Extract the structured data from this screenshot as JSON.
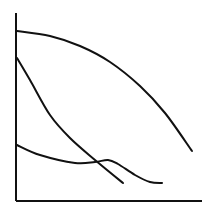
{
  "chart_data": {
    "type": "line",
    "title": "",
    "xlabel": "",
    "ylabel": "",
    "grid": false,
    "legend": null,
    "axes": {
      "y_axis": {
        "x": 16,
        "y1": 13,
        "y2": 201
      },
      "x_axis": {
        "y": 201,
        "x1": 16,
        "x2": 202
      }
    },
    "series": [
      {
        "name": "curve-1",
        "points": [
          [
            17,
            31
          ],
          [
            50,
            36
          ],
          [
            80,
            46
          ],
          [
            110,
            62
          ],
          [
            140,
            86
          ],
          [
            165,
            113
          ],
          [
            192,
            151
          ]
        ]
      },
      {
        "name": "curve-2",
        "points": [
          [
            17,
            58
          ],
          [
            30,
            80
          ],
          [
            50,
            115
          ],
          [
            70,
            138
          ],
          [
            95,
            160
          ],
          [
            123,
            183
          ]
        ]
      },
      {
        "name": "curve-3",
        "points": [
          [
            17,
            145
          ],
          [
            40,
            155
          ],
          [
            75,
            163
          ],
          [
            95,
            162
          ],
          [
            108,
            160
          ],
          [
            118,
            164
          ],
          [
            135,
            175
          ],
          [
            150,
            182
          ],
          [
            162,
            183
          ]
        ]
      }
    ],
    "stroke_color": "#111111"
  }
}
